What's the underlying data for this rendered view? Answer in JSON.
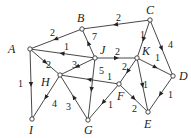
{
  "diagram": {
    "type": "directed-weighted-graph",
    "nodes": [
      {
        "id": "A",
        "x": 30,
        "y": 49,
        "lx": 8,
        "ly": 53
      },
      {
        "id": "B",
        "x": 82,
        "y": 29,
        "lx": 77,
        "ly": 22
      },
      {
        "id": "C",
        "x": 150,
        "y": 20,
        "lx": 146,
        "ly": 14
      },
      {
        "id": "D",
        "x": 173,
        "y": 76,
        "lx": 179,
        "ly": 80
      },
      {
        "id": "E",
        "x": 148,
        "y": 112,
        "lx": 144,
        "ly": 128
      },
      {
        "id": "F",
        "x": 119,
        "y": 84,
        "lx": 117,
        "ly": 100
      },
      {
        "id": "G",
        "x": 88,
        "y": 120,
        "lx": 84,
        "ly": 134
      },
      {
        "id": "H",
        "x": 60,
        "y": 75,
        "lx": 41,
        "ly": 86
      },
      {
        "id": "I",
        "x": 32,
        "y": 119,
        "lx": 29,
        "ly": 134
      },
      {
        "id": "J",
        "x": 95,
        "y": 58,
        "lx": 100,
        "ly": 54
      },
      {
        "id": "K",
        "x": 137,
        "y": 58,
        "lx": 142,
        "ly": 55
      }
    ],
    "edges": [
      {
        "from": "B",
        "to": "A",
        "weight": "2",
        "wx": 50,
        "wy": 36
      },
      {
        "from": "J",
        "to": "A",
        "weight": "1",
        "wx": 64,
        "wy": 50
      },
      {
        "from": "A",
        "to": "H",
        "weight": "2",
        "wx": 46,
        "wy": 68
      },
      {
        "from": "A",
        "to": "I",
        "weight": "1",
        "wx": 18,
        "wy": 87
      },
      {
        "from": "C",
        "to": "B",
        "weight": "2",
        "wx": 116,
        "wy": 21
      },
      {
        "from": "J",
        "to": "B",
        "weight": "7",
        "wx": 92,
        "wy": 40
      },
      {
        "from": "C",
        "to": "K",
        "weight": "1",
        "wx": 140,
        "wy": 38
      },
      {
        "from": "C",
        "to": "D",
        "weight": "4",
        "wx": 168,
        "wy": 48
      },
      {
        "from": "J",
        "to": "K",
        "weight": "2",
        "wx": 115,
        "wy": 55
      },
      {
        "from": "J",
        "to": "H",
        "weight": "3",
        "wx": 72,
        "wy": 68
      },
      {
        "from": "J",
        "to": "G",
        "weight": "5",
        "wx": 99,
        "wy": 74
      },
      {
        "from": "K",
        "to": "F",
        "weight": "2",
        "wx": 122,
        "wy": 70
      },
      {
        "from": "K",
        "to": "D",
        "weight": "1",
        "wx": 155,
        "wy": 61
      },
      {
        "from": "K",
        "to": "E",
        "weight": "1",
        "wx": 143,
        "wy": 88
      },
      {
        "from": "F",
        "to": "H",
        "weight": "1",
        "wx": 107,
        "wy": 80
      },
      {
        "from": "F",
        "to": "G",
        "weight": "1",
        "wx": 108,
        "wy": 108
      },
      {
        "from": "F",
        "to": "E",
        "weight": "2",
        "wx": 132,
        "wy": 112
      },
      {
        "from": "D",
        "to": "E",
        "weight": "1",
        "wx": 168,
        "wy": 98
      },
      {
        "from": "H",
        "to": "I",
        "weight": "4",
        "wx": 52,
        "wy": 107
      },
      {
        "from": "G",
        "to": "H",
        "weight": "3",
        "wx": 66,
        "wy": 110
      }
    ]
  }
}
